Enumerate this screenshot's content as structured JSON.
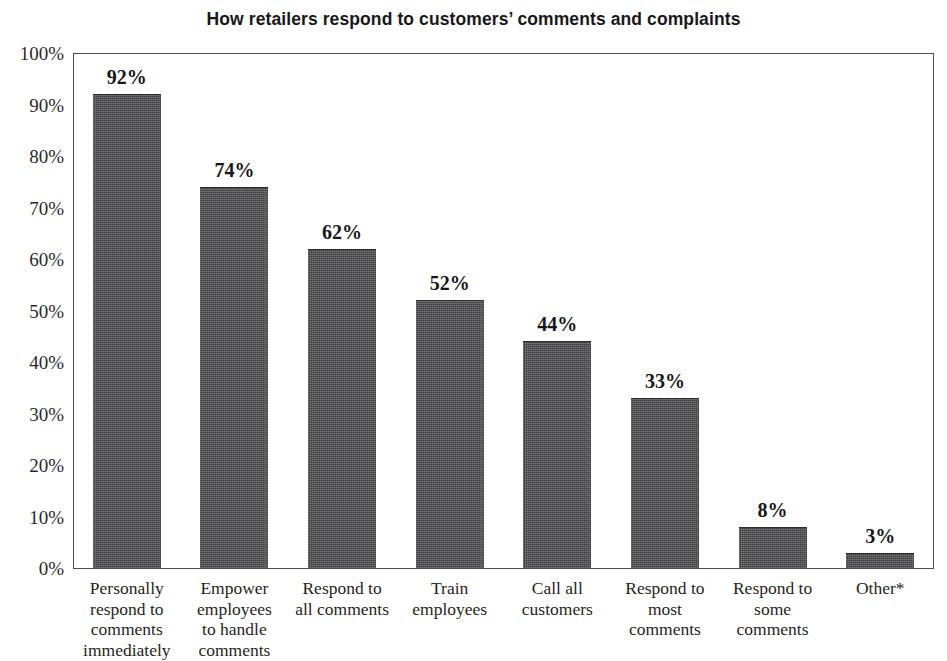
{
  "chart_data": {
    "type": "bar",
    "title": "How retailers respond to customers’ comments and complaints",
    "xlabel": "",
    "ylabel": "",
    "ylim": [
      0,
      100
    ],
    "grid": false,
    "legend": "none",
    "value_label_suffix": "%",
    "categories": [
      "Personally respond to comments immediately",
      "Empower employees to handle comments",
      "Respond to all comments",
      "Train employees",
      "Call all customers",
      "Respond to most comments",
      "Respond to some comments",
      "Other*"
    ],
    "category_lines": [
      [
        "Personally",
        "respond to",
        "comments",
        "immediately"
      ],
      [
        "Empower",
        "employees",
        "to handle",
        "comments"
      ],
      [
        "Respond to",
        "all comments"
      ],
      [
        "Train",
        "employees"
      ],
      [
        "Call all",
        "customers"
      ],
      [
        "Respond to",
        "most",
        "comments"
      ],
      [
        "Respond to",
        "some",
        "comments"
      ],
      [
        "Other*"
      ]
    ],
    "values": [
      92,
      74,
      62,
      52,
      44,
      33,
      8,
      3
    ],
    "value_labels": [
      "92%",
      "74%",
      "62%",
      "52%",
      "44%",
      "33%",
      "8%",
      "3%"
    ],
    "y_ticks": [
      0,
      10,
      20,
      30,
      40,
      50,
      60,
      70,
      80,
      90,
      100
    ],
    "y_tick_labels": [
      "0%",
      "10%",
      "20%",
      "30%",
      "40%",
      "50%",
      "60%",
      "70%",
      "80%",
      "90%",
      "100%"
    ],
    "colors": {
      "bar_fill": "#4d4d4f",
      "bar_edge": "#2e2e30",
      "axis": "#4e4e50",
      "text": "#1f1f22",
      "background": "#ffffff"
    }
  }
}
